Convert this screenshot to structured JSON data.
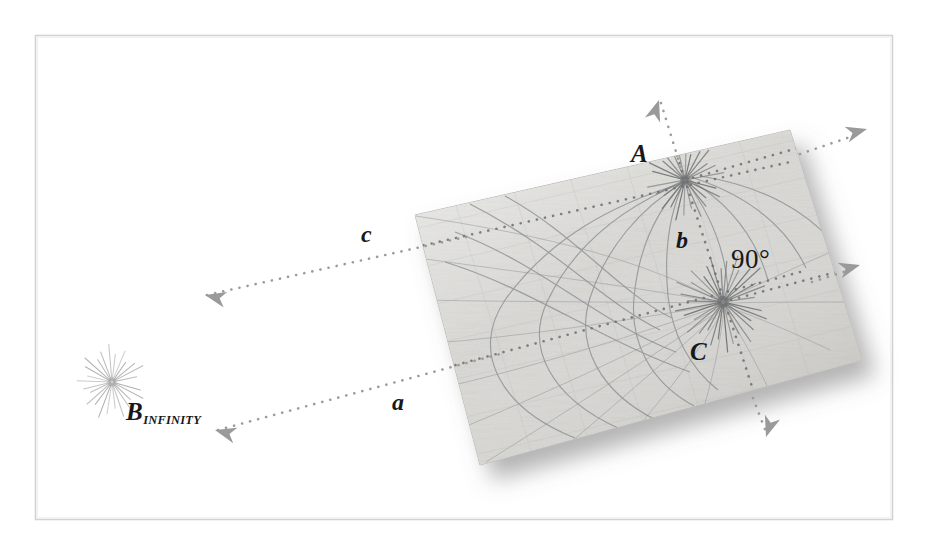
{
  "figure": {
    "background_color": "#ffffff",
    "frame": {
      "name": "figure-border",
      "stroke_color": "#c9c9c9",
      "x": 35,
      "y": 35,
      "width": 858,
      "height": 485
    },
    "card": {
      "name": "textured-paper-panel",
      "fill_color": "#d6d5d1",
      "edge_color": "#b9b8b4",
      "shadow_color": "#8f8f8f",
      "corners": [
        [
          415,
          215
        ],
        [
          790,
          130
        ],
        [
          862,
          360
        ],
        [
          480,
          465
        ]
      ]
    },
    "colors": {
      "label_text": "#17181a",
      "dotted_line": "#8e8e8e",
      "arrow_head": "#9a9a9a",
      "curve": "#7d7f80",
      "starburst_ray": "#6f7172",
      "starburst_ray_light": "#a7a8a9"
    }
  },
  "labels": [
    {
      "id": "label-A",
      "name": "point-label-A",
      "text": "A",
      "style": "italic",
      "x": 631,
      "y": 141,
      "font_size": 25
    },
    {
      "id": "label-C",
      "name": "point-label-C",
      "text": "C",
      "style": "italic",
      "x": 690,
      "y": 339,
      "font_size": 25
    },
    {
      "id": "label-b",
      "name": "line-label-b",
      "text": "b",
      "style": "italic",
      "x": 676,
      "y": 228,
      "font_size": 24
    },
    {
      "id": "label-c",
      "name": "line-label-c",
      "text": "c",
      "style": "italic",
      "x": 361,
      "y": 222,
      "font_size": 24
    },
    {
      "id": "label-a",
      "name": "line-label-a",
      "text": "a",
      "style": "italic",
      "x": 392,
      "y": 390,
      "font_size": 24
    },
    {
      "id": "label-angle",
      "name": "right-angle-label",
      "text": "90°",
      "style": "upright",
      "x": 731,
      "y": 246,
      "font_size": 27
    }
  ],
  "infinity_point": {
    "name": "point-label-B-infinity",
    "main_text": "B",
    "subscript_text": "INFINITY",
    "x": 126,
    "y": 399,
    "font_size": 25
  },
  "points": [
    {
      "name": "starburst-A",
      "label": "A",
      "cx": 685,
      "cy": 180,
      "rays": 28,
      "radius": 36,
      "on_card": true
    },
    {
      "name": "starburst-C",
      "label": "C",
      "cx": 723,
      "cy": 302,
      "rays": 34,
      "radius": 44,
      "on_card": true
    },
    {
      "name": "starburst-B-infinity",
      "label": "B_INFINITY",
      "cx": 112,
      "cy": 382,
      "rays": 26,
      "radius": 33,
      "on_card": false
    }
  ],
  "dotted_lines": [
    {
      "name": "dotted-line-c",
      "label": "c",
      "x1": 205,
      "y1": 295,
      "x2": 760,
      "y2": 168,
      "arrow_start": true,
      "arrow_end": false
    },
    {
      "name": "dotted-line-a",
      "label": "a",
      "x1": 215,
      "y1": 430,
      "x2": 760,
      "y2": 283,
      "arrow_start": true,
      "arrow_end": false
    },
    {
      "name": "dotted-line-b-through-A-C",
      "label": "b",
      "x1": 659,
      "y1": 100,
      "x2": 766,
      "y2": 432,
      "arrow_start": true,
      "arrow_end": true
    },
    {
      "name": "dotted-line-through-C-right",
      "label": "",
      "x1": 723,
      "y1": 302,
      "x2": 858,
      "y2": 266,
      "arrow_start": false,
      "arrow_end": true
    },
    {
      "name": "dotted-line-through-A-upright",
      "label": "",
      "x1": 685,
      "y1": 180,
      "x2": 866,
      "y2": 130,
      "arrow_start": false,
      "arrow_end": true
    }
  ],
  "arrowheads": [
    {
      "name": "arrowhead-c-left",
      "x": 205,
      "y": 295,
      "angle": 193
    },
    {
      "name": "arrowhead-a-left",
      "x": 215,
      "y": 430,
      "angle": 195
    },
    {
      "name": "arrowhead-b-up",
      "x": 659,
      "y": 100,
      "angle": 288
    },
    {
      "name": "arrowhead-b-down",
      "x": 766,
      "y": 437,
      "angle": 108
    },
    {
      "name": "arrowhead-c-right",
      "x": 867,
      "y": 129,
      "angle": 345
    },
    {
      "name": "arrowhead-right-edge",
      "x": 860,
      "y": 265,
      "angle": 345
    }
  ],
  "chart_data": {
    "type": "diagram",
    "annotations": [
      "A",
      "C",
      "b",
      "c",
      "a",
      "90°",
      "B INFINITY"
    ]
  }
}
